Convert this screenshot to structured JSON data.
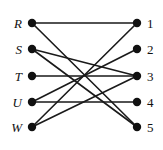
{
  "figure": {
    "background_color": "#ffffff",
    "edge_color": "#1a1a1a",
    "node_color": "#111111",
    "width": 163,
    "height": 150
  },
  "chart_data": {
    "type": "diagram",
    "subtype": "bipartite-graph",
    "title": "",
    "left_nodes": [
      {
        "id": "R",
        "label": "R",
        "x": 32,
        "y": 23
      },
      {
        "id": "S",
        "label": "S",
        "x": 32,
        "y": 49
      },
      {
        "id": "T",
        "label": "T",
        "x": 32,
        "y": 76
      },
      {
        "id": "U",
        "label": "U",
        "x": 32,
        "y": 102
      },
      {
        "id": "W",
        "label": "W",
        "x": 32,
        "y": 127
      }
    ],
    "right_nodes": [
      {
        "id": "1",
        "label": "1",
        "x": 137,
        "y": 23
      },
      {
        "id": "2",
        "label": "2",
        "x": 137,
        "y": 49
      },
      {
        "id": "3",
        "label": "3",
        "x": 137,
        "y": 76
      },
      {
        "id": "4",
        "label": "4",
        "x": 137,
        "y": 102
      },
      {
        "id": "5",
        "label": "5",
        "x": 137,
        "y": 127
      }
    ],
    "edges": [
      {
        "from": "R",
        "to": "1"
      },
      {
        "from": "R",
        "to": "5"
      },
      {
        "from": "S",
        "to": "3"
      },
      {
        "from": "S",
        "to": "5"
      },
      {
        "from": "T",
        "to": "3"
      },
      {
        "from": "U",
        "to": "2"
      },
      {
        "from": "U",
        "to": "4"
      },
      {
        "from": "W",
        "to": "1"
      },
      {
        "from": "W",
        "to": "3"
      }
    ],
    "left_labels": [
      "R",
      "S",
      "T",
      "U",
      "W"
    ],
    "right_labels": [
      "1",
      "2",
      "3",
      "4",
      "5"
    ],
    "node_radius": 4.2
  }
}
